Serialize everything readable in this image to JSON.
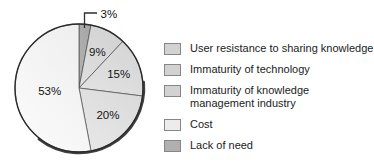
{
  "chart_data": {
    "type": "pie",
    "direction": "clockwise",
    "start_angle_deg_from_top": 0,
    "grid": false,
    "legend_position": "right",
    "slices": [
      {
        "label": "Lack of need",
        "value": 3,
        "display": "3%",
        "color": "#a6a6a6",
        "callout": true
      },
      {
        "label": "User resistance to sharing knowledge",
        "value": 9,
        "display": "9%",
        "color": "#d2d2d2",
        "callout": false
      },
      {
        "label": "Immaturity of technology",
        "value": 15,
        "display": "15%",
        "color": "#d5d5d5",
        "callout": false
      },
      {
        "label": "Immaturity of knowledge management industry",
        "value": 20,
        "display": "20%",
        "color": "#dadada",
        "callout": false
      },
      {
        "label": "Cost",
        "value": 53,
        "display": "53%",
        "color": "#eeeeee",
        "callout": false
      }
    ],
    "legend": [
      {
        "label": "User resistance to sharing knowledge",
        "color": "#d2d2d2",
        "gap_before": false
      },
      {
        "label": "Immaturity of technology",
        "color": "#d2d2d2",
        "gap_before": false
      },
      {
        "label": "Immaturity of knowledge\nmanagement industry",
        "color": "#d2d2d2",
        "gap_before": false
      },
      {
        "label": "Cost",
        "color": "#ececec",
        "gap_before": true
      },
      {
        "label": "Lack of need",
        "color": "#b0b0b0",
        "gap_before": false
      }
    ],
    "colors": {
      "outline": "#2b2b2b",
      "separator": "#4a4a4a",
      "shadow": "#1f1f1f",
      "leader_line": "#2e2e2e",
      "text": "#141414",
      "background": "#ffffff"
    }
  }
}
